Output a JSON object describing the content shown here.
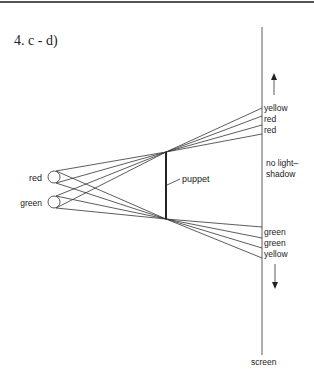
{
  "heading": "4. c - d)",
  "diagram": {
    "lights": [
      {
        "label": "red",
        "color_name": "red"
      },
      {
        "label": "green",
        "color_name": "green"
      }
    ],
    "puppet_label": "puppet",
    "screen_label": "screen",
    "upper_screen_labels": [
      "yellow",
      "red",
      "red"
    ],
    "middle_screen_label_line1": "no light–",
    "middle_screen_label_line2": "shadow",
    "lower_screen_labels": [
      "green",
      "green",
      "yellow"
    ],
    "arrows": [
      "up-arrow",
      "down-arrow"
    ],
    "line_color": "#333333"
  }
}
